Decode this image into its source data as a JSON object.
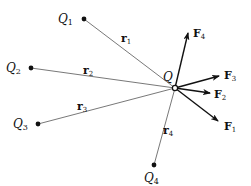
{
  "figure": {
    "colors": {
      "line": "#555555",
      "arrow": "#111111",
      "text": "#111111",
      "background": "#ffffff"
    }
  },
  "center_charge": {
    "label": "Q",
    "x": 175,
    "y": 88
  },
  "source_charges": [
    {
      "id": "Q1",
      "label": "Q",
      "sub": "1",
      "x": 84,
      "y": 19,
      "lx": 58,
      "ly": 23
    },
    {
      "id": "Q2",
      "label": "Q",
      "sub": "2",
      "x": 31,
      "y": 68,
      "lx": 6,
      "ly": 72
    },
    {
      "id": "Q3",
      "label": "Q",
      "sub": "3",
      "x": 38,
      "y": 124,
      "lx": 13,
      "ly": 128
    },
    {
      "id": "Q4",
      "label": "Q",
      "sub": "4",
      "x": 154,
      "y": 165,
      "lx": 144,
      "ly": 182
    }
  ],
  "distance_vectors": [
    {
      "label": "r",
      "sub": "1",
      "lx": 121,
      "ly": 42
    },
    {
      "label": "r",
      "sub": "2",
      "lx": 83,
      "ly": 74
    },
    {
      "label": "r",
      "sub": "3",
      "lx": 77,
      "ly": 110
    },
    {
      "label": "r",
      "sub": "4",
      "lx": 163,
      "ly": 134
    }
  ],
  "forces": [
    {
      "label": "F",
      "sub": "1",
      "tx": 218,
      "ty": 121,
      "lx": 224,
      "ly": 130
    },
    {
      "label": "F",
      "sub": "2",
      "tx": 210,
      "ty": 93,
      "lx": 214,
      "ly": 98
    },
    {
      "label": "F",
      "sub": "3",
      "tx": 219,
      "ty": 76,
      "lx": 224,
      "ly": 79
    },
    {
      "label": "F",
      "sub": "4",
      "tx": 188,
      "ty": 33,
      "lx": 193,
      "ly": 37
    }
  ]
}
